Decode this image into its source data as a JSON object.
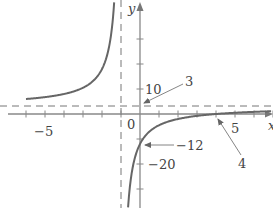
{
  "chart_data": {
    "type": "line",
    "title": "",
    "function": "y = 3 - 15/(x+1)",
    "xlabel": "x",
    "ylabel": "y",
    "xlim": [
      -7.4,
      7.0
    ],
    "ylim": [
      -37.6,
      45.2
    ],
    "grid": false,
    "x_ticks": [
      -6,
      -5,
      -4,
      -3,
      -2,
      -1,
      0,
      1,
      2,
      3,
      4,
      5,
      6,
      7
    ],
    "x_tick_labels": [
      {
        "value": -5,
        "label": "−5"
      },
      {
        "value": 5,
        "label": "5"
      }
    ],
    "y_ticks": [
      -30,
      -20,
      -10,
      10,
      20,
      30
    ],
    "y_tick_labels": [
      {
        "value": 10,
        "label": "10"
      },
      {
        "value": -20,
        "label": "−20"
      }
    ],
    "origin_label": "0",
    "asymptotes": {
      "vertical": {
        "x": -1,
        "style": "dashed"
      },
      "horizontal": {
        "y": 3,
        "style": "dashed"
      }
    },
    "annotations": [
      {
        "label": "3",
        "points_to": [
          0,
          3
        ],
        "meaning": "horizontal asymptote y-value"
      },
      {
        "label": "−12",
        "points_to": [
          0,
          -12
        ],
        "meaning": "y-intercept"
      },
      {
        "label": "4",
        "points_to": [
          4,
          0
        ],
        "meaning": "x-intercept"
      }
    ],
    "series": [
      {
        "name": "left branch",
        "x": [
          -7.4,
          -6,
          -5,
          -4,
          -3,
          -2.5,
          -2,
          -1.8,
          -1.6,
          -1.5
        ],
        "y": [
          5.34,
          6.0,
          6.75,
          8.0,
          10.5,
          13.0,
          18.0,
          21.75,
          28.0,
          33.0
        ]
      },
      {
        "name": "right branch",
        "x": [
          -0.6,
          -0.5,
          -0.3,
          0,
          0.5,
          1,
          2,
          3,
          4,
          5,
          6,
          7
        ],
        "y": [
          -34.5,
          -27.0,
          -18.43,
          -12.0,
          -7.0,
          -4.5,
          -2.0,
          -0.75,
          0.0,
          0.5,
          0.86,
          1.13
        ]
      }
    ]
  },
  "labels": {
    "y_axis": "y",
    "x_axis": "x",
    "origin": "0",
    "x_neg5": "−5",
    "x_pos5": "5",
    "y_pos10": "10",
    "y_neg20": "−20",
    "callout_asymptote": "3",
    "callout_y_intercept": "−12",
    "callout_x_intercept": "4"
  }
}
